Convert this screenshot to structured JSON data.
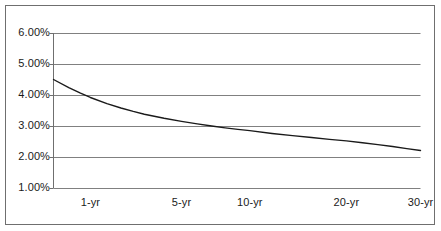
{
  "chart_data": {
    "type": "line",
    "title": "",
    "subtitle": "",
    "xlabel": "",
    "ylabel": "",
    "grid": true,
    "legend": false,
    "legend_position": "none",
    "line_color": "#1a1a1a",
    "grid_color": "#808080",
    "axis_color": "#6f6f6f",
    "border_color": "#6f6f6f",
    "background_color": "#ffffff",
    "x_tick_labels": [
      "1-yr",
      "5-yr",
      "10-yr",
      "20-yr",
      "30-yr"
    ],
    "x_tick_values": [
      1,
      5,
      10,
      20,
      30
    ],
    "y_tick_labels": [
      "6.00%",
      "5.00%",
      "4.00%",
      "3.00%",
      "2.00%",
      "1.00%"
    ],
    "y_tick_values": [
      6.0,
      5.0,
      4.0,
      3.0,
      2.0,
      1.0
    ],
    "ylim": [
      1.0,
      6.0
    ],
    "xlim": [
      0.25,
      30
    ],
    "series": [
      {
        "name": "Yield curve",
        "x": [
          0.25,
          0.5,
          0.75,
          1,
          1.5,
          2,
          2.5,
          3,
          4,
          5,
          6,
          7,
          8,
          9,
          10,
          12,
          14,
          16,
          18,
          20,
          22,
          24,
          26,
          28,
          30
        ],
        "values": [
          4.5,
          4.24,
          4.06,
          3.92,
          3.72,
          3.58,
          3.47,
          3.38,
          3.25,
          3.15,
          3.07,
          3.0,
          2.94,
          2.89,
          2.85,
          2.76,
          2.69,
          2.63,
          2.57,
          2.52,
          2.46,
          2.4,
          2.34,
          2.27,
          2.21
        ]
      }
    ]
  },
  "figure": {
    "axis_labels": {
      "y": [
        "6.00%",
        "5.00%",
        "4.00%",
        "3.00%",
        "2.00%",
        "1.00%"
      ],
      "x": [
        "1-yr",
        "5-yr",
        "10-yr",
        "20-yr",
        "30-yr"
      ]
    }
  }
}
